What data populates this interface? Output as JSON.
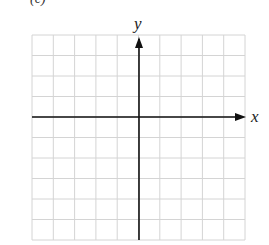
{
  "figure": {
    "part_label": "(c)",
    "x_axis_label": "x",
    "y_axis_label": "y",
    "grid": {
      "columns": 10,
      "rows": 10,
      "left": 32,
      "top": 35,
      "right": 245,
      "bottom": 240,
      "line_color": "#d4d4d4"
    },
    "axes": {
      "x_axis_y": 117,
      "y_axis_x": 139,
      "color": "#111111"
    }
  }
}
